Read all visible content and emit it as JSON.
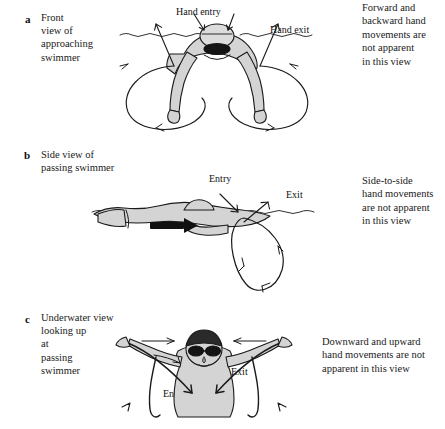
{
  "figure": {
    "type": "swimming-stroke-viewpoint-diagram",
    "ink_color": "#1a1a1a",
    "body_fill_color": "#d9d9d9",
    "background_color": "#ffffff"
  },
  "panels": [
    {
      "letter": "a",
      "caption_left": "Front\nview of\napproaching\nswimmer",
      "caption_right": "Forward and\nbackward hand\nmovements are\nnot apparent\nin this view",
      "annotations": [
        {
          "name": "hand-entry",
          "label": "Hand entry"
        },
        {
          "name": "hand-exit",
          "label": "Hand exit"
        }
      ]
    },
    {
      "letter": "b",
      "caption_left": "Side view of\npassing swimmer",
      "caption_right": "Side-to-side\nhand movements\nare not apparent\nin this view",
      "annotations": [
        {
          "name": "entry",
          "label": "Entry"
        },
        {
          "name": "exit",
          "label": "Exit"
        }
      ]
    },
    {
      "letter": "c",
      "caption_left": "Underwater view\nlooking up\nat\npassing\nswimmer",
      "caption_right": "Downward and upward\nhand movements are not\napparent in this view",
      "annotations": [
        {
          "name": "entry",
          "label": "Entry"
        },
        {
          "name": "exit",
          "label": "Exit"
        }
      ]
    }
  ]
}
